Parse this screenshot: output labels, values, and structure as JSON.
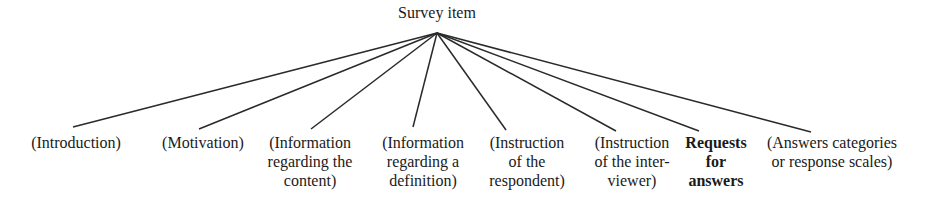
{
  "diagram": {
    "root": {
      "label": "Survey item",
      "x": 437,
      "y": 33
    },
    "children": [
      {
        "lines": [
          "(Introduction)"
        ],
        "x": 76,
        "end": [
          73,
          127
        ],
        "bold": false
      },
      {
        "lines": [
          "(Motivation)"
        ],
        "x": 203,
        "end": [
          199,
          129
        ],
        "bold": false
      },
      {
        "lines": [
          "(Information",
          "regarding the",
          "content)"
        ],
        "x": 310,
        "end": [
          311,
          129
        ],
        "bold": false
      },
      {
        "lines": [
          "(Information",
          "regarding a",
          "definition)"
        ],
        "x": 423,
        "end": [
          413,
          127
        ],
        "bold": false
      },
      {
        "lines": [
          "(Instruction",
          "of the",
          "respondent)"
        ],
        "x": 527,
        "end": [
          506,
          130
        ],
        "bold": false
      },
      {
        "lines": [
          "(Instruction",
          "of the inter-",
          "viewer)"
        ],
        "x": 632,
        "end": [
          616,
          131
        ],
        "bold": false
      },
      {
        "lines": [
          "Requests",
          "for",
          "answers"
        ],
        "x": 716,
        "end": [
          699,
          131
        ],
        "bold": true
      },
      {
        "lines": [
          "(Answers categories",
          "or response scales)"
        ],
        "x": 832,
        "end": [
          811,
          132
        ],
        "bold": false
      }
    ],
    "line_color": "#2a2a2a"
  }
}
